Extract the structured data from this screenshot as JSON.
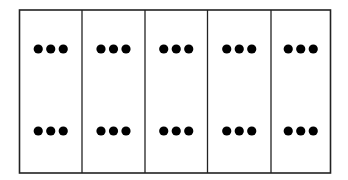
{
  "diagram": {
    "title": "",
    "columns": [
      {
        "label": "",
        "groups": [
          {
            "position": "top",
            "dot_count": 3
          },
          {
            "position": "bottom",
            "dot_count": 3
          }
        ]
      },
      {
        "label": "",
        "groups": [
          {
            "position": "top",
            "dot_count": 3
          },
          {
            "position": "bottom",
            "dot_count": 3
          }
        ]
      },
      {
        "label": "",
        "groups": [
          {
            "position": "top",
            "dot_count": 3
          },
          {
            "position": "bottom",
            "dot_count": 3
          }
        ]
      },
      {
        "label": "",
        "groups": [
          {
            "position": "top",
            "dot_count": 3
          },
          {
            "position": "bottom",
            "dot_count": 3
          }
        ]
      },
      {
        "label": "",
        "groups": [
          {
            "position": "top",
            "dot_count": 3
          },
          {
            "position": "bottom",
            "dot_count": 3
          }
        ]
      }
    ],
    "colors": {
      "line": "#222222",
      "dot": "#000000",
      "background": "#ffffff"
    }
  }
}
